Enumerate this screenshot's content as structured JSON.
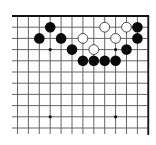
{
  "diagram": {
    "type": "go-board-fragment",
    "corner": "top-right",
    "columns": 13,
    "rows": 11,
    "grid": {
      "origin_x": 17.5,
      "origin_y": 16,
      "spacing_x": 10.9,
      "spacing_y": 11.2,
      "line_color": "#555555",
      "edge_color": "#111111"
    },
    "star_points": [
      [
        3,
        3
      ],
      [
        9,
        3
      ],
      [
        3,
        9
      ],
      [
        9,
        9
      ]
    ],
    "stones": {
      "black": [
        [
          3,
          1
        ],
        [
          2,
          2
        ],
        [
          4,
          2
        ],
        [
          5,
          3
        ],
        [
          6,
          4
        ],
        [
          7,
          4
        ],
        [
          8,
          4
        ],
        [
          9,
          4
        ],
        [
          10,
          3
        ],
        [
          11,
          1
        ],
        [
          11,
          2
        ]
      ],
      "white": [
        [
          8,
          1
        ],
        [
          10,
          1
        ],
        [
          6,
          2
        ],
        [
          9,
          2
        ],
        [
          7,
          3
        ]
      ]
    },
    "colors": {
      "black_stone": "#0a0a0a",
      "white_stone_fill": "#ffffff",
      "white_stone_stroke": "#222222",
      "background": "#ffffff"
    }
  }
}
